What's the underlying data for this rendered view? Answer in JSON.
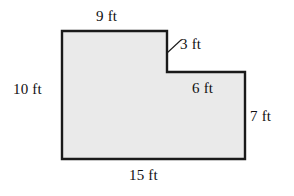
{
  "figure": {
    "type": "composite-rectilinear-polygon",
    "units": "ft",
    "fill_color": "#eaeaea",
    "stroke_color": "#1a1a1a",
    "background_color": "#ffffff",
    "vertices": [
      {
        "x": 62,
        "y": 31
      },
      {
        "x": 167,
        "y": 31
      },
      {
        "x": 167,
        "y": 72
      },
      {
        "x": 245,
        "y": 72
      },
      {
        "x": 245,
        "y": 159
      },
      {
        "x": 62,
        "y": 159
      }
    ],
    "polygon_points": "62,31 167,31 167,72 245,72 245,159 62,159",
    "leader_line": {
      "name": "notch-leader-line",
      "x1": 167,
      "y1": 53,
      "x2": 181,
      "y2": 40
    },
    "labels": {
      "top": "9 ft",
      "notch_vertical": "3 ft",
      "left": "10 ft",
      "inner_horizontal": "6 ft",
      "right": "7 ft",
      "bottom": "15 ft"
    }
  },
  "chart_data": {
    "type": "table",
    "title": "",
    "categories": [
      "top",
      "notch_vertical",
      "left",
      "inner_horizontal",
      "right",
      "bottom"
    ],
    "values": [
      9,
      3,
      10,
      6,
      7,
      15
    ],
    "labels": [
      "9 ft",
      "3 ft",
      "10 ft",
      "6 ft",
      "7 ft",
      "15 ft"
    ],
    "xlabel": "",
    "ylabel": ""
  }
}
